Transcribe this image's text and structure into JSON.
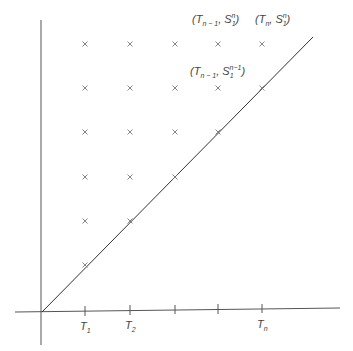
{
  "diagram": {
    "type": "lattice-points-diagram",
    "axes": {
      "x_tick_labels": [
        {
          "base": "T",
          "sub": "1",
          "x": 85
        },
        {
          "base": "T",
          "sub": "2",
          "x": 130
        },
        {
          "base": "",
          "sub": "",
          "x": 175
        },
        {
          "base": "",
          "sub": "",
          "x": 218
        },
        {
          "base": "T",
          "sub": "n",
          "x": 262
        }
      ]
    },
    "diagonal_line": {
      "from": [
        42,
        312
      ],
      "to": [
        313,
        37
      ]
    },
    "grid_columns_x": [
      85,
      130,
      175,
      218,
      262
    ],
    "grid_rows_y": [
      44,
      88,
      132,
      177,
      221,
      265
    ],
    "annotations": [
      {
        "id": "top-left",
        "text": "(T_{n-1}, S_1^n)",
        "parts": {
          "a": "T",
          "a_sub": "n − 1",
          "b": "S",
          "b_sub": "1",
          "b_sup": "n"
        },
        "x": 192,
        "y": 12
      },
      {
        "id": "top-right",
        "text": "(T_n, S_1^n)",
        "parts": {
          "a": "T",
          "a_sub": "n",
          "b": "S",
          "b_sub": "1",
          "b_sup": "n"
        },
        "x": 252,
        "y": 12
      },
      {
        "id": "mid",
        "text": "(T_{n-1}, S_1^{n-1})",
        "parts": {
          "a": "T",
          "a_sub": "n − 1",
          "b": "S",
          "b_sub": "1",
          "b_sup": "n−1"
        },
        "x": 190,
        "y": 64
      }
    ],
    "colors": {
      "line": "#333333",
      "mark": "#666666",
      "text": "#444444"
    }
  }
}
